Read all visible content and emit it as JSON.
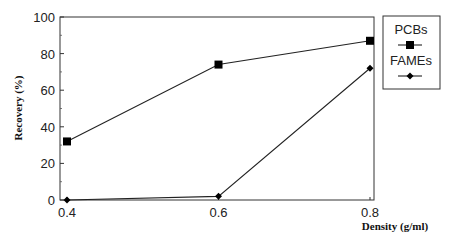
{
  "chart_data": {
    "type": "line",
    "title": "",
    "xlabel": "Density (g/ml)",
    "ylabel": "Recovery (%)",
    "x": [
      0.4,
      0.6,
      0.8
    ],
    "x_ticks": [
      "0.4",
      "0.6",
      "0.8"
    ],
    "y_ticks": [
      "0",
      "20",
      "40",
      "60",
      "80",
      "100"
    ],
    "xlim": [
      0.39,
      0.81
    ],
    "ylim": [
      0,
      100
    ],
    "grid": false,
    "legend_position": "right-outside",
    "series": [
      {
        "name": "PCBs",
        "marker": "square",
        "values": [
          32,
          74,
          87
        ]
      },
      {
        "name": "FAMEs",
        "marker": "diamond",
        "values": [
          0,
          2,
          72
        ]
      }
    ]
  }
}
